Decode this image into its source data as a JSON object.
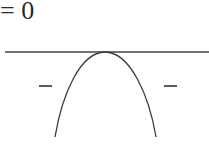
{
  "equation": {
    "text": "= 0"
  },
  "diagram": {
    "axis": {
      "x1": 5,
      "y": 52,
      "x2": 209
    },
    "curve": {
      "apex": {
        "x": 105,
        "y": 52
      },
      "left_end": {
        "x": 55,
        "y": 137
      },
      "right_end": {
        "x": 156,
        "y": 137
      }
    },
    "sign_left": "−",
    "sign_right": "−",
    "stroke_color": "#3a3a3a"
  }
}
